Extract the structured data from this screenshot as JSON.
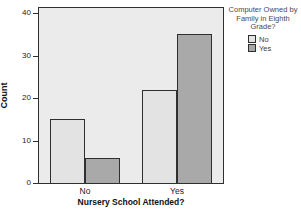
{
  "chart_data": {
    "type": "bar",
    "categories": [
      "No",
      "Yes"
    ],
    "series": [
      {
        "name": "No",
        "values": [
          15,
          22
        ],
        "color": "#e3e3e3"
      },
      {
        "name": "Yes",
        "values": [
          6,
          35
        ],
        "color": "#a9a9a9"
      }
    ],
    "xlabel": "Nursery School Attended?",
    "ylabel": "Count",
    "yticks": [
      0,
      10,
      20,
      30,
      40
    ],
    "ylim": [
      0,
      41.2
    ],
    "grid": false,
    "legend_position": "top-right",
    "legend_title": "Computer Owned by Family in Eighth Grade?",
    "legend_title_lines": [
      "Computer Owned by",
      "Family in Eighth",
      "Grade?"
    ],
    "legend_entries": [
      "No",
      "Yes"
    ],
    "plot_background": "#ebebeb",
    "border_color": "#2f2f2f"
  }
}
